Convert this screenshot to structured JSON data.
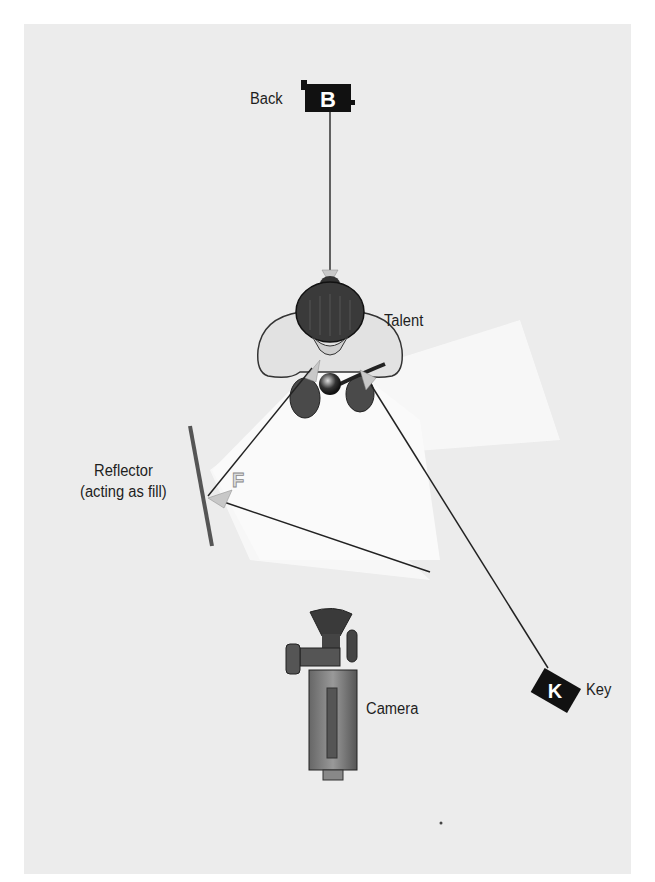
{
  "diagram": {
    "type": "lighting-setup-top-view",
    "background_color": "#ececec",
    "labels": {
      "back": "Back",
      "talent": "Talent",
      "reflector_line1": "Reflector",
      "reflector_line2": "(acting as fill)",
      "camera": "Camera",
      "key": "Key"
    },
    "markers": {
      "back_letter": "B",
      "key_letter": "K",
      "fill_letter": "F"
    },
    "elements": [
      {
        "id": "back-light",
        "label": "Back",
        "marker": "B",
        "position": [
          330,
          100
        ]
      },
      {
        "id": "talent",
        "label": "Talent",
        "position": [
          330,
          330
        ]
      },
      {
        "id": "reflector",
        "label": "Reflector (acting as fill)",
        "marker": "F",
        "position": [
          200,
          460
        ]
      },
      {
        "id": "camera",
        "label": "Camera",
        "position": [
          330,
          680
        ]
      },
      {
        "id": "key-light",
        "label": "Key",
        "marker": "K",
        "position": [
          555,
          690
        ]
      }
    ]
  }
}
